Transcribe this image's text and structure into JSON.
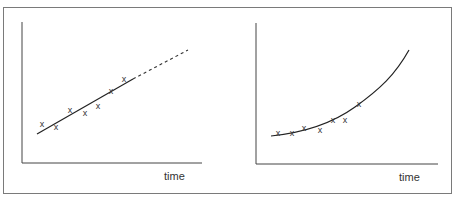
{
  "chart_data": [
    {
      "type": "scatter",
      "title": "",
      "xlabel": "time",
      "ylabel": "",
      "grid": false,
      "description": "Linear trend fitted to data points, extrapolated with a dashed line",
      "points": [
        {
          "x": 42,
          "y": 124
        },
        {
          "x": 56,
          "y": 127
        },
        {
          "x": 70,
          "y": 110
        },
        {
          "x": 85,
          "y": 113
        },
        {
          "x": 98,
          "y": 106
        },
        {
          "x": 111,
          "y": 91
        },
        {
          "x": 124,
          "y": 79
        }
      ],
      "fit": {
        "kind": "linear",
        "solid": [
          [
            37,
            134
          ],
          [
            133,
            79
          ]
        ],
        "dashed": [
          [
            133,
            79
          ],
          [
            188,
            50
          ]
        ]
      }
    },
    {
      "type": "scatter",
      "title": "",
      "xlabel": "time",
      "ylabel": "",
      "grid": false,
      "description": "Exponential / accelerating curve fitted to data points",
      "points": [
        {
          "x": 278,
          "y": 133
        },
        {
          "x": 292,
          "y": 133
        },
        {
          "x": 304,
          "y": 128
        },
        {
          "x": 320,
          "y": 130
        },
        {
          "x": 333,
          "y": 120
        },
        {
          "x": 345,
          "y": 120
        },
        {
          "x": 359,
          "y": 104
        }
      ],
      "fit": {
        "kind": "exponential",
        "path": [
          [
            271,
            136
          ],
          [
            300,
            131
          ],
          [
            330,
            122
          ],
          [
            360,
            103
          ],
          [
            390,
            75
          ],
          [
            409,
            50
          ]
        ]
      }
    }
  ],
  "labels": {
    "left_x": "time",
    "right_x": "time"
  },
  "marker": "x"
}
